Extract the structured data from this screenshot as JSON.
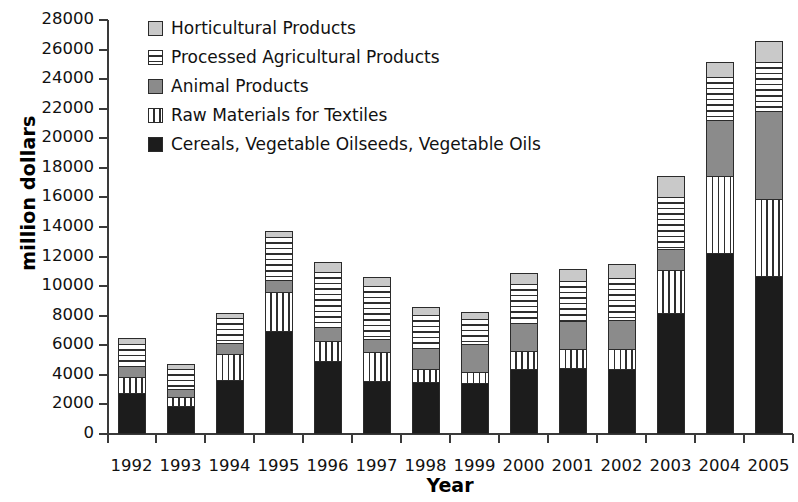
{
  "chart_data": {
    "type": "bar",
    "stacked": true,
    "title": "",
    "xlabel": "Year",
    "ylabel": "million dollars",
    "ylim": [
      0,
      28000
    ],
    "ytick_step": 2000,
    "yticks": [
      0,
      2000,
      4000,
      6000,
      8000,
      10000,
      12000,
      14000,
      16000,
      18000,
      20000,
      22000,
      24000,
      26000,
      28000
    ],
    "grid": false,
    "legend_position": "top-left",
    "categories": [
      "1992",
      "1993",
      "1994",
      "1995",
      "1996",
      "1997",
      "1998",
      "1999",
      "2000",
      "2001",
      "2002",
      "2003",
      "2004",
      "2005"
    ],
    "series": [
      {
        "name": "Cereals, Vegetable Oilseeds, Vegetable Oils",
        "pattern": "solid-black",
        "color": "#1c1c1c",
        "values": [
          2700,
          1850,
          3600,
          6900,
          4850,
          3550,
          3450,
          3400,
          4350,
          4400,
          4350,
          8100,
          12200,
          10600
        ]
      },
      {
        "name": "Raw Materials for Textiles",
        "pattern": "vertical-stripes",
        "color": "#ffffff",
        "values": [
          1100,
          600,
          1750,
          2650,
          1350,
          1950,
          900,
          750,
          1200,
          1300,
          1300,
          2900,
          5200,
          5200
        ]
      },
      {
        "name": "Animal Products",
        "pattern": "solid-gray",
        "color": "#8b8b8b",
        "values": [
          700,
          500,
          750,
          800,
          950,
          850,
          1400,
          1900,
          1900,
          1850,
          2000,
          1450,
          3800,
          6000
        ]
      },
      {
        "name": "Processed Agricultural Products",
        "pattern": "horizontal-stripes",
        "color": "#ffffff",
        "values": [
          1550,
          1400,
          1700,
          2900,
          3750,
          3600,
          2250,
          1650,
          2600,
          2700,
          2850,
          3500,
          2900,
          3300
        ]
      },
      {
        "name": "Horticultural Products",
        "pattern": "light-gray",
        "color": "#c9c9c9",
        "values": [
          350,
          350,
          300,
          400,
          700,
          600,
          550,
          500,
          800,
          850,
          950,
          1400,
          1000,
          1400
        ]
      }
    ],
    "totals": [
      6400,
      4700,
      8100,
      13650,
      11600,
      10550,
      8550,
      8200,
      10850,
      11100,
      11450,
      17350,
      25100,
      26500
    ]
  }
}
